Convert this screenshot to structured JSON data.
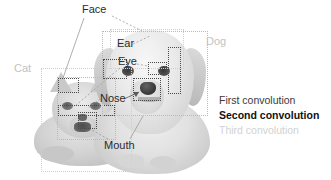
{
  "figure": {
    "title_label": "",
    "photo": {
      "animals": [
        {
          "name": "cat",
          "alt_text": "Cat photo"
        },
        {
          "name": "dog",
          "alt_text": "Dog photo"
        }
      ]
    },
    "part_labels": [
      {
        "key": "face",
        "text": "Face",
        "style": "dark"
      },
      {
        "key": "ear",
        "text": "Ear",
        "style": "dark"
      },
      {
        "key": "eye",
        "text": "Eye",
        "style": "dark"
      },
      {
        "key": "nose",
        "text": "Nose",
        "style": "dark"
      },
      {
        "key": "mouth",
        "text": "Mouth",
        "style": "dark"
      }
    ],
    "class_labels": [
      {
        "key": "cat",
        "text": "Cat",
        "style": "faint"
      },
      {
        "key": "dog",
        "text": "Dog",
        "style": "faint"
      }
    ],
    "legend": {
      "items": [
        {
          "key": "first",
          "text": "First convolution",
          "color": "#3a3a3a",
          "weight": "normal"
        },
        {
          "key": "second",
          "text": "Second convolution",
          "color": "#111111",
          "weight": "bold"
        },
        {
          "key": "third",
          "text": "Third convolution",
          "color": "#d2d2d2",
          "weight": "normal"
        }
      ]
    },
    "boxes": [
      {
        "key": "cat-outer",
        "level": "third",
        "role": "cat-class-region"
      },
      {
        "key": "cat-face",
        "level": "first",
        "role": "cat-face-region"
      },
      {
        "key": "cat-ear",
        "level": "second",
        "role": "cat-ear-region"
      },
      {
        "key": "cat-eyes",
        "level": "second",
        "role": "cat-eyes-region"
      },
      {
        "key": "cat-mouth",
        "level": "second",
        "role": "cat-mouth-region"
      },
      {
        "key": "dog-outer",
        "level": "third",
        "role": "dog-class-region"
      },
      {
        "key": "dog-face",
        "level": "first",
        "role": "dog-face-region"
      },
      {
        "key": "dog-ear",
        "level": "second",
        "role": "dog-ear-region"
      },
      {
        "key": "dog-eye",
        "level": "second",
        "role": "dog-eye-region"
      },
      {
        "key": "dog-nose",
        "level": "second",
        "role": "dog-nose-region"
      },
      {
        "key": "dog-tall-right",
        "level": "second",
        "role": "dog-side-region"
      }
    ],
    "colors": {
      "first_convolution": "#b9b9b9",
      "second_convolution": "#4a4a4a",
      "third_convolution": "#cfcfcf",
      "background": "#ffffff"
    }
  }
}
